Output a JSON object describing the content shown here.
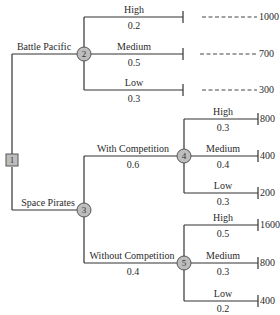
{
  "diagram": {
    "type": "decision-tree",
    "colors": {
      "line": "#333333",
      "node_fill": "#bdbdbd",
      "node_stroke": "#555555"
    },
    "decision_node": {
      "id": "1"
    },
    "alternatives": [
      {
        "label": "Battle Pacific",
        "chance_node": "2",
        "outcomes": [
          {
            "label": "High",
            "prob": "0.2",
            "payoff": "1000"
          },
          {
            "label": "Medium",
            "prob": "0.5",
            "payoff": "700"
          },
          {
            "label": "Low",
            "prob": "0.3",
            "payoff": "300"
          }
        ]
      },
      {
        "label": "Space Pirates",
        "chance_node": "3",
        "branches": [
          {
            "label": "With Competition",
            "prob": "0.6",
            "chance_node": "4",
            "outcomes": [
              {
                "label": "High",
                "prob": "0.3",
                "payoff": "800"
              },
              {
                "label": "Medium",
                "prob": "0.4",
                "payoff": "400"
              },
              {
                "label": "Low",
                "prob": "0.3",
                "payoff": "200"
              }
            ]
          },
          {
            "label": "Without Competition",
            "prob": "0.4",
            "chance_node": "5",
            "outcomes": [
              {
                "label": "High",
                "prob": "0.5",
                "payoff": "1600"
              },
              {
                "label": "Medium",
                "prob": "0.3",
                "payoff": "800"
              },
              {
                "label": "Low",
                "prob": "0.2",
                "payoff": "400"
              }
            ]
          }
        ]
      }
    ]
  }
}
